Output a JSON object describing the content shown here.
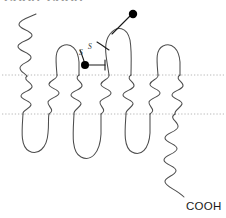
{
  "figure": {
    "kind": "protein-membrane-topology-diagram",
    "width": 226,
    "height": 218,
    "background_color": "#ffffff",
    "top_caption_clipped": "COOH, COOH",
    "chain_stroke_color": "#4d4d4d",
    "membrane_line_color": "#b0b0b0",
    "site_dot_color": "#000000"
  },
  "labels": {
    "c_terminus": "COOH",
    "disulfide_left": "S",
    "disulfide_right": "S"
  },
  "membrane": {
    "upper_boundary_y": 75,
    "lower_boundary_y": 114,
    "boundary_style": "dotted"
  },
  "transmembrane_helices": [
    {
      "index": 1,
      "x": 27
    },
    {
      "index": 2,
      "x": 53
    },
    {
      "index": 3,
      "x": 78
    },
    {
      "index": 4,
      "x": 103
    },
    {
      "index": 5,
      "x": 128
    },
    {
      "index": 6,
      "x": 150
    },
    {
      "index": 7,
      "x": 172
    }
  ],
  "termini": {
    "n_terminus_side": "extracellular",
    "c_terminus_side": "intracellular"
  },
  "modification_sites": [
    {
      "name": "site-dot-upper",
      "x": 133,
      "y": 14
    },
    {
      "name": "site-dot-lower",
      "x": 85,
      "y": 65
    }
  ],
  "counts": {
    "transmembrane_helices": 7,
    "intracellular_loops": 3,
    "extracellular_loops": 3,
    "disulfide_bonds": 1,
    "marked_sites": 2
  }
}
